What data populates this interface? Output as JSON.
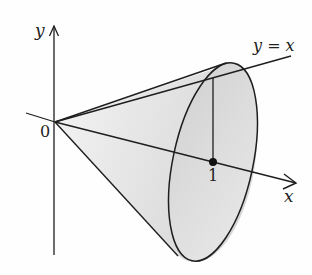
{
  "figure": {
    "labels": {
      "y_axis": "y",
      "x_axis": "x",
      "origin": "0",
      "line": "y = x",
      "point": "1"
    },
    "colors": {
      "stroke": "#1e1e1e",
      "cone_fill": "#e4e4e4",
      "base_fill": "#dadada",
      "background": "#fefefe"
    }
  }
}
